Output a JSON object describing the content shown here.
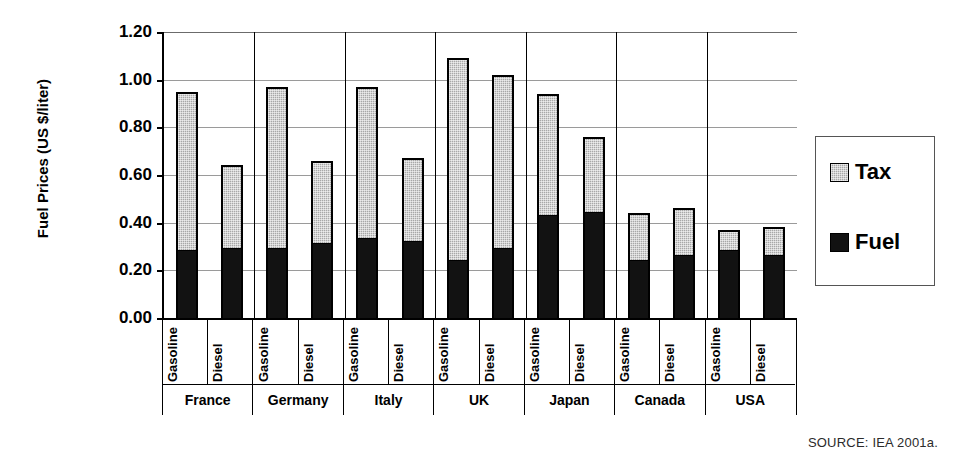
{
  "chart_data": {
    "type": "bar",
    "title": "",
    "xlabel": "",
    "ylabel": "Fuel Prices (US $/liter)",
    "ylim": [
      0.0,
      1.2
    ],
    "ytick_labels": [
      "0.00",
      "0.20",
      "0.40",
      "0.60",
      "0.80",
      "1.00",
      "1.20"
    ],
    "ytick_values": [
      0.0,
      0.2,
      0.4,
      0.6,
      0.8,
      1.0,
      1.2
    ],
    "grid": true,
    "stacked": true,
    "legend_position": "right",
    "legend": [
      "Tax",
      "Fuel"
    ],
    "groups": [
      "France",
      "Germany",
      "Italy",
      "UK",
      "Japan",
      "Canada",
      "USA"
    ],
    "subcategories": [
      "Gasoline",
      "Diesel"
    ],
    "categories": [
      "France Gasoline",
      "France Diesel",
      "Germany Gasoline",
      "Germany Diesel",
      "Italy Gasoline",
      "Italy Diesel",
      "UK Gasoline",
      "UK Diesel",
      "Japan Gasoline",
      "Japan Diesel",
      "Canada Gasoline",
      "Canada Diesel",
      "USA Gasoline",
      "USA Diesel"
    ],
    "series": [
      {
        "name": "Fuel",
        "color": "#121212",
        "values": [
          0.28,
          0.29,
          0.29,
          0.31,
          0.33,
          0.32,
          0.24,
          0.29,
          0.43,
          0.44,
          0.24,
          0.26,
          0.28,
          0.26
        ]
      },
      {
        "name": "Tax",
        "color": "#a8a8a8",
        "values": [
          0.67,
          0.35,
          0.68,
          0.35,
          0.64,
          0.35,
          0.85,
          0.73,
          0.51,
          0.32,
          0.2,
          0.2,
          0.09,
          0.12
        ]
      }
    ],
    "totals": [
      0.95,
      0.64,
      0.97,
      0.66,
      0.97,
      0.67,
      1.09,
      1.02,
      0.94,
      0.76,
      0.44,
      0.46,
      0.37,
      0.38
    ],
    "bars": [
      {
        "group": "France",
        "sub": "Gasoline",
        "fuel": 0.28,
        "tax": 0.67,
        "total": 0.95
      },
      {
        "group": "France",
        "sub": "Diesel",
        "fuel": 0.29,
        "tax": 0.35,
        "total": 0.64
      },
      {
        "group": "Germany",
        "sub": "Gasoline",
        "fuel": 0.29,
        "tax": 0.68,
        "total": 0.97
      },
      {
        "group": "Germany",
        "sub": "Diesel",
        "fuel": 0.31,
        "tax": 0.35,
        "total": 0.66
      },
      {
        "group": "Italy",
        "sub": "Gasoline",
        "fuel": 0.33,
        "tax": 0.64,
        "total": 0.97
      },
      {
        "group": "Italy",
        "sub": "Diesel",
        "fuel": 0.32,
        "tax": 0.35,
        "total": 0.67
      },
      {
        "group": "UK",
        "sub": "Gasoline",
        "fuel": 0.24,
        "tax": 0.85,
        "total": 1.09
      },
      {
        "group": "UK",
        "sub": "Diesel",
        "fuel": 0.29,
        "tax": 0.73,
        "total": 1.02
      },
      {
        "group": "Japan",
        "sub": "Gasoline",
        "fuel": 0.43,
        "tax": 0.51,
        "total": 0.94
      },
      {
        "group": "Japan",
        "sub": "Diesel",
        "fuel": 0.44,
        "tax": 0.32,
        "total": 0.76
      },
      {
        "group": "Canada",
        "sub": "Gasoline",
        "fuel": 0.24,
        "tax": 0.2,
        "total": 0.44
      },
      {
        "group": "Canada",
        "sub": "Diesel",
        "fuel": 0.26,
        "tax": 0.2,
        "total": 0.46
      },
      {
        "group": "USA",
        "sub": "Gasoline",
        "fuel": 0.28,
        "tax": 0.09,
        "total": 0.37
      },
      {
        "group": "USA",
        "sub": "Diesel",
        "fuel": 0.26,
        "tax": 0.12,
        "total": 0.38
      }
    ]
  },
  "source_note": "SOURCE: IEA 2001a."
}
